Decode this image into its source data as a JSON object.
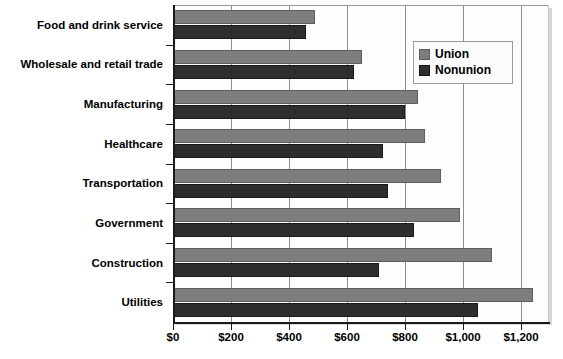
{
  "chart_data": {
    "type": "bar",
    "orientation": "horizontal",
    "title": "",
    "subtitle": "",
    "xlabel": "",
    "ylabel": "",
    "xlim": [
      0,
      1300
    ],
    "grid": true,
    "grid_axis": "x",
    "legend_position": "top-right",
    "categories": [
      "Food and drink service",
      "Wholesale and retail trade",
      "Manufacturing",
      "Healthcare",
      "Transportation",
      "Government",
      "Construction",
      "Utilities"
    ],
    "series": [
      {
        "name": "Union",
        "color": "#7d7d7d",
        "values": [
          490,
          650,
          845,
          870,
          925,
          990,
          1100,
          1240
        ]
      },
      {
        "name": "Nonunion",
        "color": "#2e2e2e",
        "values": [
          460,
          625,
          800,
          725,
          740,
          830,
          710,
          1050
        ]
      }
    ],
    "xticks": [
      {
        "value": 0,
        "label": "$0"
      },
      {
        "value": 200,
        "label": "$200"
      },
      {
        "value": 400,
        "label": "$400"
      },
      {
        "value": 600,
        "label": "$600"
      },
      {
        "value": 800,
        "label": "$800"
      },
      {
        "value": 1000,
        "label": "$1,000"
      },
      {
        "value": 1200,
        "label": "$1,200"
      }
    ]
  },
  "legend": {
    "items": [
      {
        "label": "Union"
      },
      {
        "label": "Nonunion"
      }
    ]
  }
}
